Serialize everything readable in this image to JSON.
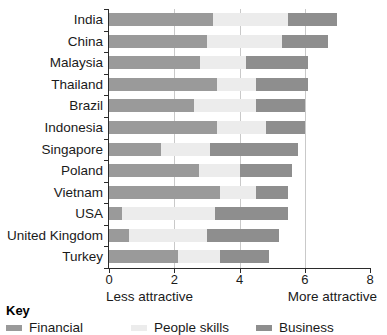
{
  "chart_data": {
    "type": "bar",
    "orientation": "horizontal",
    "stacked": true,
    "title": "",
    "xlabel": "",
    "ylabel": "",
    "xlim": [
      0,
      8
    ],
    "xticks": [
      0,
      2,
      4,
      6,
      8
    ],
    "xtick_labels": [
      "0",
      "2",
      "4",
      "6",
      "8"
    ],
    "gridlines": [
      2,
      4,
      6
    ],
    "grid": true,
    "legend_position": "below",
    "categories": [
      "India",
      "China",
      "Malaysia",
      "Thailand",
      "Brazil",
      "Indonesia",
      "Singapore",
      "Poland",
      "Vietnam",
      "USA",
      "United Kingdom",
      "Turkey"
    ],
    "series": [
      {
        "name": "Financial",
        "color": "#9a9a9a",
        "values": [
          3.2,
          3.0,
          2.8,
          3.3,
          2.6,
          3.3,
          1.6,
          2.75,
          3.4,
          0.4,
          0.6,
          2.1
        ]
      },
      {
        "name": "People skills",
        "color": "#ececec",
        "values": [
          2.3,
          2.3,
          1.4,
          1.2,
          1.9,
          1.5,
          1.5,
          1.25,
          1.1,
          2.85,
          2.4,
          1.3
        ]
      },
      {
        "name": "Business",
        "color": "#8e8e8e",
        "values": [
          1.5,
          1.4,
          1.9,
          1.6,
          1.5,
          1.2,
          2.7,
          1.6,
          1.0,
          2.25,
          2.2,
          1.5
        ]
      }
    ],
    "totals": [
      7.0,
      6.7,
      6.1,
      6.1,
      6.0,
      6.0,
      5.8,
      5.6,
      5.5,
      5.5,
      5.2,
      4.9
    ],
    "annotations": {
      "left": "Less attractive",
      "right": "More attractive"
    }
  },
  "key": {
    "title": "Key",
    "items": [
      {
        "label": "Financial",
        "color": "#9a9a9a"
      },
      {
        "label": "People skills",
        "color": "#ececec"
      },
      {
        "label": "Business",
        "color": "#8e8e8e"
      }
    ]
  }
}
